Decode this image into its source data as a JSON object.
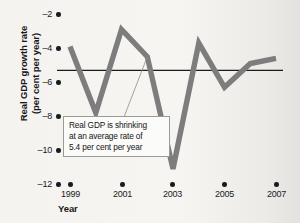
{
  "chart_data": {
    "type": "line",
    "title": "",
    "xlabel": "Year",
    "ylabel": "Real GDP growth rate (per cent per year)",
    "ylabel_line1": "Real GDP growth rate",
    "ylabel_line2": "(per cent per year)",
    "xlim": [
      1998.5,
      2007.5
    ],
    "ylim": [
      -12,
      -1
    ],
    "yticks": [
      -2,
      -4,
      -6,
      -8,
      -10,
      -12
    ],
    "ytick_labels": [
      "–2",
      "–4",
      "–6",
      "–8",
      "–10",
      "–12"
    ],
    "xticks": [
      1999,
      2001,
      2003,
      2005,
      2007
    ],
    "xtick_labels": [
      "1999",
      "2001",
      "2003",
      "2005",
      "2007"
    ],
    "grid": false,
    "legend": "none",
    "series": [
      {
        "name": "Real GDP growth rate",
        "color": "#7d7d7d",
        "x": [
          1999,
          2000,
          2001,
          2002,
          2003,
          2004,
          2005,
          2006,
          2007
        ],
        "values": [
          -4.0,
          -7.9,
          -3.0,
          -4.6,
          -11.2,
          -3.8,
          -6.4,
          -5.0,
          -4.7
        ]
      }
    ],
    "reference_line": {
      "name": "average growth rate",
      "value": -5.4,
      "color": "#1a1b1d"
    },
    "annotations": [
      {
        "name": "average-rate-callout",
        "line1": "Real GDP is shrinking",
        "line2": "at an average rate of",
        "line3": "5.4 per cent per year"
      }
    ]
  }
}
